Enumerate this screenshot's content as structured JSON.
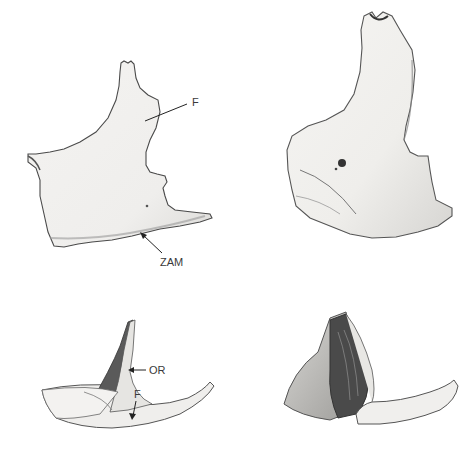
{
  "figure": {
    "panels": [
      {
        "id": "top-left",
        "view": "lateral view",
        "labels": [
          {
            "text": "F"
          },
          {
            "text": "ZAM"
          }
        ]
      },
      {
        "id": "top-right",
        "view": "lateral view (second specimen)",
        "labels": []
      },
      {
        "id": "bottom-left",
        "view": "orbital/inferior view",
        "labels": [
          {
            "text": "OR"
          },
          {
            "text": "F"
          }
        ]
      },
      {
        "id": "bottom-right",
        "view": "orbital/inferior view (second specimen)",
        "labels": []
      }
    ]
  },
  "colors": {
    "background": "#ffffff",
    "bone_fill": "#f1f0ee",
    "bone_outline": "#4a4a4a",
    "shadow": "#7a7a7a",
    "dark_shadow": "#3a3a3a",
    "label_text": "#3a3a3a"
  }
}
